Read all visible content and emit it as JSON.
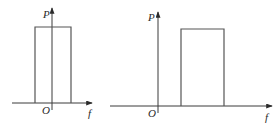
{
  "diagrams": [
    {
      "id": "left",
      "description": "Rectangular spectrum centered at origin",
      "y_axis_label": "P",
      "x_axis_label": "f",
      "origin_label": "O",
      "axis": {
        "origin_x": 52,
        "origin_y": 103,
        "x_start": 12,
        "x_end": 92,
        "y_top": 8
      },
      "rect": {
        "x1": 35,
        "x2": 71,
        "top": 27
      }
    },
    {
      "id": "right",
      "description": "Rectangular spectrum shifted to positive frequencies",
      "y_axis_label": "P",
      "x_axis_label": "f",
      "origin_label": "O",
      "axis": {
        "origin_x": 158,
        "origin_y": 106,
        "x_start": 110,
        "x_end": 272,
        "y_top": 12
      },
      "rect": {
        "x1": 181,
        "x2": 224,
        "top": 29
      }
    }
  ],
  "colors": {
    "line": "#3a3a3a",
    "rect": "#555555",
    "background": "#ffffff"
  }
}
